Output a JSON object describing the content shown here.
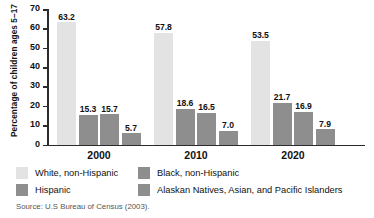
{
  "chart_data": {
    "type": "bar",
    "title": "",
    "xlabel": "",
    "ylabel": "Percentage of children ages 5–17",
    "ylim": [
      0,
      70
    ],
    "yticks": [
      0,
      10,
      20,
      30,
      40,
      50,
      60,
      70
    ],
    "ytick_labels": [
      "0",
      "10",
      "20",
      "30",
      "40",
      "50",
      "60",
      "70"
    ],
    "grid": false,
    "legend_position": "below-plot",
    "categories": [
      "2000",
      "2010",
      "2020"
    ],
    "series": [
      {
        "name": "White, non-Hispanic",
        "color": "#e3e3e3",
        "values": [
          63.2,
          57.8,
          53.5
        ],
        "labels": [
          "63.2",
          "57.8",
          "53.5"
        ]
      },
      {
        "name": "Black, non-Hispanic",
        "color": "#8e8e8e",
        "values": [
          15.3,
          18.6,
          21.7
        ],
        "labels": [
          "15.3",
          "18.6",
          "21.7"
        ]
      },
      {
        "name": "Hispanic",
        "color": "#8e8e8e",
        "values": [
          15.7,
          16.5,
          16.9
        ],
        "labels": [
          "15.7",
          "16.5",
          "16.9"
        ]
      },
      {
        "name": "Alaskan Natives, Asian, and Pacific Islanders",
        "color": "#8e8e8e",
        "values": [
          5.7,
          7.0,
          7.9
        ],
        "labels": [
          "5.7",
          "7.0",
          "7.9"
        ]
      }
    ]
  },
  "axis": {
    "y_title": "Percentage of children ages 5–17",
    "y_ticks": [
      "70",
      "60",
      "50",
      "40",
      "30",
      "20",
      "10",
      "0"
    ]
  },
  "groups": [
    {
      "label": "2000",
      "bars": [
        {
          "name": "white-non-hispanic",
          "value": 63.2,
          "label": "63.2",
          "color": "#e3e3e3"
        },
        {
          "name": "black-non-hispanic",
          "value": 15.3,
          "label": "15.3",
          "color": "#8e8e8e"
        },
        {
          "name": "hispanic",
          "value": 15.7,
          "label": "15.7",
          "color": "#8e8e8e"
        },
        {
          "name": "alaskan-asian-pacific",
          "value": 5.7,
          "label": "5.7",
          "color": "#8e8e8e"
        }
      ]
    },
    {
      "label": "2010",
      "bars": [
        {
          "name": "white-non-hispanic",
          "value": 57.8,
          "label": "57.8",
          "color": "#e3e3e3"
        },
        {
          "name": "black-non-hispanic",
          "value": 18.6,
          "label": "18.6",
          "color": "#8e8e8e"
        },
        {
          "name": "hispanic",
          "value": 16.5,
          "label": "16.5",
          "color": "#8e8e8e"
        },
        {
          "name": "alaskan-asian-pacific",
          "value": 7.0,
          "label": "7.0",
          "color": "#8e8e8e"
        }
      ]
    },
    {
      "label": "2020",
      "bars": [
        {
          "name": "white-non-hispanic",
          "value": 53.5,
          "label": "53.5",
          "color": "#e3e3e3"
        },
        {
          "name": "black-non-hispanic",
          "value": 21.7,
          "label": "21.7",
          "color": "#8e8e8e"
        },
        {
          "name": "hispanic",
          "value": 16.9,
          "label": "16.9",
          "color": "#8e8e8e"
        },
        {
          "name": "alaskan-asian-pacific",
          "value": 7.9,
          "label": "7.9",
          "color": "#8e8e8e"
        }
      ]
    }
  ],
  "legend": {
    "items": [
      {
        "label": "White, non-Hispanic",
        "color": "#e3e3e3"
      },
      {
        "label": "Black, non-Hispanic",
        "color": "#8e8e8e"
      },
      {
        "label": "Hispanic",
        "color": "#8e8e8e"
      },
      {
        "label": "Alaskan Natives, Asian, and Pacific Islanders",
        "color": "#8e8e8e"
      }
    ]
  },
  "source": {
    "text": "Source: U.S Bureau of Census (2003)."
  }
}
